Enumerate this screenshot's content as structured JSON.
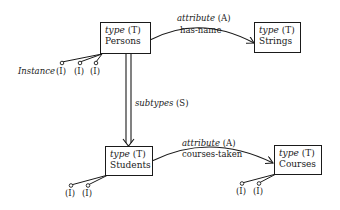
{
  "nodes": {
    "persons": {
      "kind": "type",
      "code": "(T)",
      "name": "Persons"
    },
    "strings": {
      "kind": "type",
      "code": "(T)",
      "name": "Strings"
    },
    "students": {
      "kind": "type",
      "code": "(T)",
      "name": "Students"
    },
    "courses": {
      "kind": "type",
      "code": "(T)",
      "name": "Courses"
    }
  },
  "edges": {
    "has_name": {
      "kind": "attribute",
      "code": "(A)",
      "name": "has-name"
    },
    "courses_taken": {
      "kind": "attribute",
      "code": "(A)",
      "name": "courses-taken"
    },
    "subtypes": {
      "kind": "subtypes",
      "code": "(S)"
    }
  },
  "instance": {
    "label": "Instance",
    "symbol": "(I)"
  }
}
